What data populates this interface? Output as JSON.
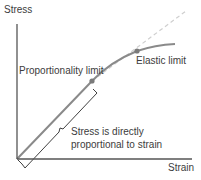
{
  "diagram": {
    "axes": {
      "y_label": "Stress",
      "x_label": "Strain"
    },
    "points": {
      "proportionality_limit": "Proportionality limit",
      "elastic_limit": "Elastic limit"
    },
    "annotation": {
      "line1": "Stress is directly",
      "line2": "proportional to strain"
    },
    "colors": {
      "axis": "#555555",
      "curve": "#8a8a8a",
      "marker": "#7a7a7a",
      "dashed": "#cfcfcf",
      "bracket": "#2a2a2a",
      "text": "#3c3c3c"
    }
  }
}
